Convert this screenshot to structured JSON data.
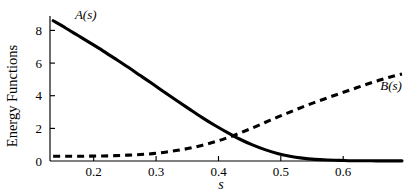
{
  "chart_data": {
    "type": "line",
    "title": "",
    "subtitle": "",
    "xlabel": "s",
    "ylabel": "Energy Functions",
    "xlim": [
      0.125,
      0.69
    ],
    "ylim": [
      0,
      9.2
    ],
    "xticks": [
      0.2,
      0.3,
      0.4,
      0.5,
      0.6
    ],
    "xtick_labels": [
      "0.2",
      "0.3",
      "0.4",
      "0.5",
      "0.6"
    ],
    "yticks": [
      0,
      2,
      4,
      6,
      8
    ],
    "ytick_labels": [
      "0",
      "2",
      "4",
      "6",
      "8"
    ],
    "grid": false,
    "legend": "inline-curve-labels",
    "annotations": [
      {
        "text": "A(s)",
        "x": 0.165,
        "y": 9.0,
        "style": "italic-serif"
      },
      {
        "text": "B(s)",
        "x": 0.655,
        "y": 4.5,
        "style": "italic-serif"
      }
    ],
    "series": [
      {
        "name": "A(s)",
        "label": "A(s)",
        "style": "solid",
        "color": "#000000",
        "x": [
          0.13,
          0.15,
          0.17,
          0.19,
          0.21,
          0.23,
          0.25,
          0.27,
          0.29,
          0.31,
          0.33,
          0.35,
          0.37,
          0.39,
          0.41,
          0.43,
          0.45,
          0.47,
          0.49,
          0.51,
          0.53,
          0.55,
          0.57,
          0.59,
          0.61,
          0.63,
          0.65,
          0.67,
          0.69
        ],
        "y": [
          8.9,
          8.44,
          7.96,
          7.48,
          6.99,
          6.48,
          5.96,
          5.42,
          4.88,
          4.33,
          3.79,
          3.26,
          2.74,
          2.25,
          1.8,
          1.38,
          1.02,
          0.72,
          0.48,
          0.3,
          0.18,
          0.1,
          0.06,
          0.04,
          0.02,
          0.02,
          0.01,
          0.01,
          0.01
        ]
      },
      {
        "name": "B(s)",
        "label": "B(s)",
        "style": "dashed",
        "color": "#000000",
        "x": [
          0.13,
          0.15,
          0.17,
          0.19,
          0.21,
          0.23,
          0.25,
          0.27,
          0.29,
          0.31,
          0.33,
          0.35,
          0.37,
          0.39,
          0.41,
          0.43,
          0.45,
          0.47,
          0.49,
          0.51,
          0.53,
          0.55,
          0.57,
          0.59,
          0.61,
          0.63,
          0.65,
          0.67,
          0.69
        ],
        "y": [
          0.3,
          0.3,
          0.3,
          0.31,
          0.32,
          0.34,
          0.37,
          0.41,
          0.47,
          0.56,
          0.68,
          0.82,
          1.0,
          1.22,
          1.48,
          1.78,
          2.1,
          2.44,
          2.78,
          3.1,
          3.42,
          3.72,
          4.0,
          4.28,
          4.55,
          4.82,
          5.08,
          5.32,
          5.52
        ]
      }
    ],
    "crossing_point": {
      "x": 0.425,
      "y": 1.55
    }
  }
}
